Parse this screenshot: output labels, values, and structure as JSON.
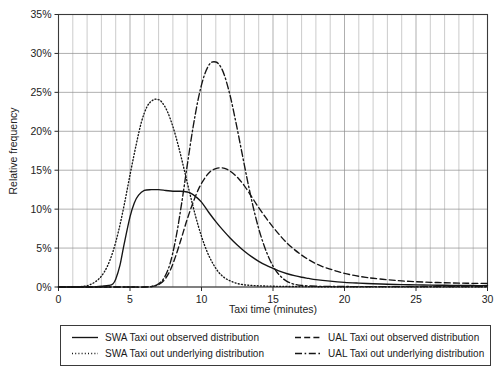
{
  "chart_data": {
    "type": "line",
    "title": "",
    "xlabel": "Taxi time (minutes)",
    "ylabel": "Relative frequency",
    "xlim": [
      0,
      30
    ],
    "ylim": [
      0,
      35
    ],
    "grid": true,
    "x_major_step": 5,
    "x_minor_step": 1,
    "y_major_step": 5,
    "legend_position": "bottom",
    "xticks": [
      0,
      5,
      10,
      15,
      20,
      25,
      30
    ],
    "xtick_labels": [
      "0",
      "5",
      "10",
      "15",
      "20",
      "25",
      "30"
    ],
    "yticks": [
      0,
      5,
      10,
      15,
      20,
      25,
      30,
      35
    ],
    "ytick_labels": [
      "0%",
      "5%",
      "10%",
      "15%",
      "20%",
      "25%",
      "30%",
      "35%"
    ],
    "series": [
      {
        "name": "SWA Taxi out observed distribution",
        "style": "solid",
        "x": [
          0,
          1,
          2,
          2.5,
          3,
          3.5,
          3.8,
          4,
          4.3,
          4.6,
          5,
          5.3,
          5.6,
          6,
          6.5,
          7,
          7.5,
          8,
          8.5,
          9,
          9.3,
          9.6,
          10,
          10.5,
          11,
          11.5,
          12,
          12.5,
          13,
          13.5,
          14,
          14.5,
          15,
          15.5,
          16,
          16.5,
          17,
          17.5,
          18,
          19,
          20,
          21,
          22,
          23,
          24,
          25,
          26,
          27,
          28,
          29,
          30
        ],
        "y": [
          0,
          0,
          0,
          0,
          0.1,
          0.2,
          0.4,
          1.0,
          2.8,
          5.6,
          9.0,
          10.8,
          11.8,
          12.4,
          12.5,
          12.5,
          12.4,
          12.3,
          12.3,
          12.2,
          12.0,
          11.6,
          10.9,
          9.6,
          8.4,
          7.3,
          6.3,
          5.4,
          4.6,
          3.9,
          3.3,
          2.8,
          2.4,
          2.0,
          1.7,
          1.45,
          1.25,
          1.1,
          0.95,
          0.75,
          0.6,
          0.5,
          0.42,
          0.35,
          0.3,
          0.27,
          0.24,
          0.22,
          0.2,
          0.19,
          0.18
        ]
      },
      {
        "name": "SWA Taxi out underlying distribution",
        "style": "dotted",
        "x": [
          0,
          1,
          1.8,
          2.2,
          2.6,
          3,
          3.4,
          3.8,
          4.2,
          4.6,
          5,
          5.4,
          5.8,
          6.2,
          6.6,
          6.9,
          7.2,
          7.6,
          8,
          8.4,
          8.8,
          9.2,
          9.6,
          10,
          10.4,
          10.8,
          11.2,
          11.6,
          12,
          12.5,
          13,
          13.5,
          14,
          14.5,
          15,
          15.5,
          16,
          17,
          18,
          19,
          20,
          22,
          24,
          26,
          28,
          30
        ],
        "y": [
          0,
          0,
          0.1,
          0.3,
          0.7,
          1.4,
          2.6,
          4.5,
          7.2,
          10.6,
          14.4,
          18.0,
          21.2,
          23.2,
          24.0,
          24.1,
          23.8,
          22.6,
          20.6,
          18.0,
          15.0,
          11.9,
          9.0,
          6.5,
          4.5,
          3.0,
          1.9,
          1.2,
          0.8,
          0.45,
          0.28,
          0.2,
          0.15,
          0.12,
          0.1,
          0.08,
          0.07,
          0.05,
          0.04,
          0.03,
          0.03,
          0.02,
          0.02,
          0.02,
          0.02,
          0.02
        ]
      },
      {
        "name": "UAL Taxi out observed distribution",
        "style": "dashed",
        "x": [
          0,
          2,
          4,
          5,
          6,
          6.6,
          7,
          7.4,
          7.8,
          8.2,
          8.6,
          9,
          9.4,
          9.8,
          10.2,
          10.6,
          11,
          11.4,
          11.8,
          12.2,
          12.6,
          13,
          13.5,
          14,
          14.5,
          15,
          15.5,
          16,
          16.5,
          17,
          17.5,
          18,
          18.5,
          19,
          19.5,
          20,
          20.5,
          21,
          21.5,
          22,
          23,
          24,
          25,
          26,
          27,
          28,
          29,
          30
        ],
        "y": [
          0,
          0,
          0,
          0,
          0,
          0.1,
          0.3,
          0.9,
          2.1,
          4.0,
          6.3,
          8.7,
          10.8,
          12.6,
          13.9,
          14.8,
          15.2,
          15.3,
          15.1,
          14.6,
          13.9,
          13.0,
          11.6,
          10.2,
          8.9,
          7.7,
          6.6,
          5.6,
          4.8,
          4.1,
          3.5,
          3.0,
          2.6,
          2.3,
          2.0,
          1.75,
          1.55,
          1.38,
          1.24,
          1.12,
          0.93,
          0.78,
          0.68,
          0.6,
          0.55,
          0.5,
          0.47,
          0.45
        ]
      },
      {
        "name": "UAL Taxi out underlying distribution",
        "style": "dashdot",
        "x": [
          0,
          2,
          4,
          5,
          6,
          6.6,
          7,
          7.4,
          7.8,
          8.2,
          8.6,
          9,
          9.4,
          9.8,
          10.2,
          10.6,
          11,
          11.3,
          11.6,
          12,
          12.4,
          12.8,
          13.2,
          13.6,
          14,
          14.4,
          14.8,
          15.2,
          15.6,
          16,
          16.5,
          17,
          18,
          19,
          20,
          22,
          24,
          26,
          28,
          30
        ],
        "y": [
          0,
          0,
          0,
          0,
          0,
          0.1,
          0.4,
          1.2,
          3.0,
          6.2,
          10.6,
          15.6,
          20.4,
          24.4,
          27.2,
          28.7,
          28.9,
          28.4,
          27.2,
          24.6,
          21.2,
          17.5,
          13.8,
          10.4,
          7.5,
          5.2,
          3.4,
          2.1,
          1.25,
          0.7,
          0.35,
          0.2,
          0.1,
          0.07,
          0.06,
          0.05,
          0.05,
          0.05,
          0.05,
          0.05
        ]
      }
    ]
  },
  "axes": {
    "y_label": "Relative frequency",
    "x_label": "Taxi time (minutes)",
    "ytick_labels": [
      "0%",
      "5%",
      "10%",
      "15%",
      "20%",
      "25%",
      "30%",
      "35%"
    ],
    "xtick_labels": [
      "0",
      "5",
      "10",
      "15",
      "20",
      "25",
      "30"
    ]
  },
  "legend": {
    "entries": [
      {
        "label": "SWA Taxi out observed distribution",
        "style": "solid"
      },
      {
        "label": "UAL Taxi out observed distribution",
        "style": "dashed"
      },
      {
        "label": "SWA Taxi out underlying distribution",
        "style": "dotted"
      },
      {
        "label": "UAL Taxi out underlying distribution",
        "style": "dashdot"
      }
    ]
  },
  "colors": {
    "line": "#151515",
    "grid": "#8c8c8c",
    "frame": "#3a3a3a",
    "background": "#ffffff",
    "text": "#1a1a1a"
  }
}
